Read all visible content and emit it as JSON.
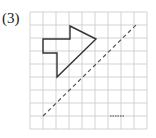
{
  "problem": {
    "label": "(3)"
  },
  "grid": {
    "origin_x": 30,
    "origin_y": 12,
    "cell": 13,
    "cols": 9,
    "rows": 9,
    "color": "#c8c8c8"
  },
  "shape": {
    "description": "arrow-shaped polygon",
    "points": "43,39 70,39 70,26 96,39 57,77 57,53 43,53",
    "stroke": "#333333"
  },
  "axis_of_symmetry": {
    "description": "dashed diagonal line",
    "x1": 43,
    "y1": 116,
    "x2": 136,
    "y2": 25,
    "stroke": "#555555"
  },
  "answer_blank": {
    "description": "short dotted segment",
    "x1": 110,
    "y1": 116,
    "x2": 124,
    "y2": 116
  }
}
